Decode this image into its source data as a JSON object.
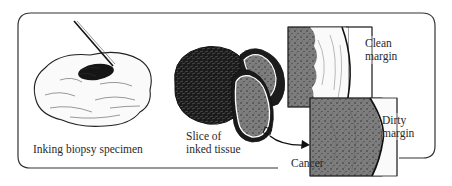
{
  "figure": {
    "left_panel": {
      "caption": "Inking biopsy specimen"
    },
    "middle_panel": {
      "caption_line1": "Slice of",
      "caption_line2": "inked tissue"
    },
    "right_panel": {
      "clean_label_line1": "Clean",
      "clean_label_line2": "margin",
      "dirty_label_line1": "Dirty",
      "dirty_label_line2": "margin",
      "cancer_label": "Cancer"
    },
    "colors": {
      "ink": "#111111",
      "tissue_gray": "#7a7a7a",
      "frame": "#333333"
    }
  }
}
